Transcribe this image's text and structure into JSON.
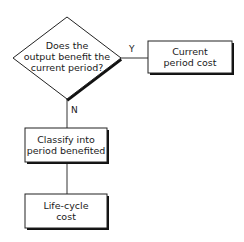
{
  "diagram": {
    "type": "flowchart",
    "nodes": [
      {
        "id": "decision",
        "shape": "diamond",
        "label": "Does the output benefit the current period?"
      },
      {
        "id": "current",
        "shape": "rectangle",
        "label": "Current period cost"
      },
      {
        "id": "classify",
        "shape": "rectangle",
        "label": "Classify into period benefited"
      },
      {
        "id": "lifecycle",
        "shape": "rectangle",
        "label": "Life-cycle cost"
      }
    ],
    "edges": [
      {
        "from": "decision",
        "to": "current",
        "label": "Y"
      },
      {
        "from": "decision",
        "to": "classify",
        "label": "N"
      },
      {
        "from": "classify",
        "to": "lifecycle",
        "label": ""
      }
    ]
  },
  "labels": {
    "decision_line1": "Does the",
    "decision_line2": "output benefit the",
    "decision_line3": "current period?",
    "current_line1": "Current",
    "current_line2": "period cost",
    "classify_line1": "Classify into",
    "classify_line2": "period benefited",
    "lifecycle_line1": "Life-cycle",
    "lifecycle_line2": "cost",
    "edge_yes": "Y",
    "edge_no": "N"
  }
}
